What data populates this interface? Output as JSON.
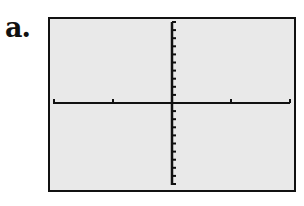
{
  "label": "a.",
  "colors": {
    "screen_bg": "#e9e9e9",
    "axis": "#111111",
    "frame": "#111111"
  },
  "chart_data": {
    "type": "line",
    "title": "",
    "xlabel": "",
    "ylabel": "",
    "series": [],
    "x_ticks_each_side": 2,
    "y_ticks_each_side": 10,
    "grid": false,
    "legend": null
  }
}
